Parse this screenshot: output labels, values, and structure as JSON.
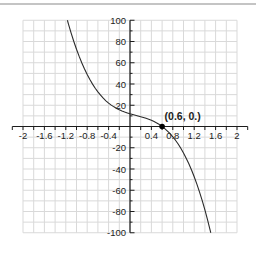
{
  "chart_data": {
    "type": "line",
    "title": "",
    "xlabel": "",
    "ylabel": "",
    "xlim": [
      -2,
      2
    ],
    "ylim": [
      -100,
      100
    ],
    "x_minor_step": 0.2,
    "y_minor_step": 10,
    "grid": true,
    "legend": "none",
    "x_tick_labels": [
      {
        "v": -2,
        "label": "-2"
      },
      {
        "v": -1.6,
        "label": "-1.6"
      },
      {
        "v": -1.2,
        "label": "-1.2"
      },
      {
        "v": -0.8,
        "label": "-0.8"
      },
      {
        "v": -0.4,
        "label": "-0.4"
      },
      {
        "v": 0.4,
        "label": "0.4"
      },
      {
        "v": 0.8,
        "label": "0.8"
      },
      {
        "v": 1.2,
        "label": "1.2"
      },
      {
        "v": 1.6,
        "label": "1.6"
      },
      {
        "v": 2,
        "label": "2"
      }
    ],
    "y_tick_labels": [
      {
        "v": 100,
        "label": "100"
      },
      {
        "v": 80,
        "label": "80"
      },
      {
        "v": 60,
        "label": "60"
      },
      {
        "v": 40,
        "label": "40"
      },
      {
        "v": 20,
        "label": "20"
      },
      {
        "v": -20,
        "label": "-20"
      },
      {
        "v": -40,
        "label": "-40"
      },
      {
        "v": -60,
        "label": "-60"
      },
      {
        "v": -80,
        "label": "-80"
      },
      {
        "v": -100,
        "label": "-100"
      }
    ],
    "annotated_point": {
      "x": 0.6,
      "y": 0,
      "label": "(0.6, 0.)"
    },
    "series": [
      {
        "name": "decreasing-cubic-curve",
        "color": "#2b2b2b",
        "points": [
          [
            -1.17,
            100
          ],
          [
            -1.15,
            96.4
          ],
          [
            -1.1,
            87.9
          ],
          [
            -1.05,
            80
          ],
          [
            -1,
            72.7
          ],
          [
            -0.95,
            66
          ],
          [
            -0.9,
            59.8
          ],
          [
            -0.85,
            54.1
          ],
          [
            -0.8,
            48.9
          ],
          [
            -0.75,
            44.2
          ],
          [
            -0.7,
            39.9
          ],
          [
            -0.65,
            36
          ],
          [
            -0.6,
            32.6
          ],
          [
            -0.55,
            29.5
          ],
          [
            -0.5,
            26.7
          ],
          [
            -0.45,
            24.2
          ],
          [
            -0.4,
            22
          ],
          [
            -0.35,
            20.1
          ],
          [
            -0.3,
            18.5
          ],
          [
            -0.25,
            17
          ],
          [
            -0.2,
            15.7
          ],
          [
            -0.15,
            14.6
          ],
          [
            -0.1,
            13.6
          ],
          [
            -0.05,
            12.8
          ],
          [
            0,
            12
          ],
          [
            0.05,
            11.3
          ],
          [
            0.1,
            10.6
          ],
          [
            0.15,
            9.9
          ],
          [
            0.2,
            9.2
          ],
          [
            0.25,
            8.5
          ],
          [
            0.3,
            7.7
          ],
          [
            0.35,
            6.8
          ],
          [
            0.4,
            5.8
          ],
          [
            0.45,
            4.6
          ],
          [
            0.5,
            3.3
          ],
          [
            0.55,
            1.8
          ],
          [
            0.6,
            0
          ],
          [
            0.65,
            -2
          ],
          [
            0.7,
            -4.3
          ],
          [
            0.75,
            -6.8
          ],
          [
            0.8,
            -9.7
          ],
          [
            0.85,
            -12.9
          ],
          [
            0.9,
            -16.5
          ],
          [
            0.95,
            -20.5
          ],
          [
            1,
            -24.9
          ],
          [
            1.05,
            -29.8
          ],
          [
            1.1,
            -35.1
          ],
          [
            1.15,
            -40.9
          ],
          [
            1.2,
            -47.3
          ],
          [
            1.25,
            -54.2
          ],
          [
            1.3,
            -61.7
          ],
          [
            1.35,
            -69.8
          ],
          [
            1.4,
            -78.5
          ],
          [
            1.45,
            -87.9
          ],
          [
            1.5,
            -97.9
          ],
          [
            1.51,
            -100
          ]
        ]
      }
    ],
    "colors": {
      "grid": "#d9d9d9",
      "axis": "#1c1c1c",
      "tick_label": "#1c1c1c",
      "curve": "#2b2b2b",
      "point": "#000000",
      "top_rule": "#c4c4c4",
      "background": "#ffffff"
    }
  }
}
